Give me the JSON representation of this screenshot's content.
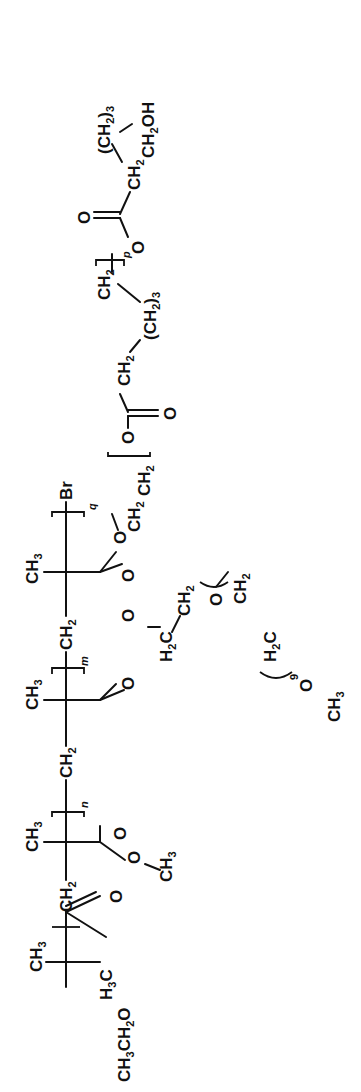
{
  "diagram": {
    "type": "chemical-structure",
    "orientation": "rotated-90-ccw",
    "initiator": {
      "ch3": "CH3",
      "h3c": "H3C",
      "ester_o": "O",
      "ethoxy": "CH3CH2O"
    },
    "block_n": {
      "backbone_ch2": "CH2",
      "ch3": "CH3",
      "carbonyl_o": "O",
      "ester_o": "O",
      "methyl": "CH3",
      "index": "n"
    },
    "block_m": {
      "backbone_ch2": "CH2",
      "ch3": "CH3",
      "carbonyl_o": "O",
      "ester_o": "O",
      "h2c": "H2C",
      "ch2": "CH2",
      "peg_o": "O",
      "peg_ch2": "CH2",
      "peg_h2c": "H2C",
      "peg_repeat": "9",
      "terminal_o": "O",
      "terminal_ch3": "CH3",
      "index": "m"
    },
    "block_q": {
      "backbone_ch2": "CH2",
      "ch3": "CH3",
      "carbonyl_o": "O",
      "ester_o": "O",
      "end_group": "Br",
      "index": "q"
    },
    "side_chain": {
      "ch2_a": "CH2",
      "ch2_b": "CH2",
      "ester_o": "O",
      "carbonyl_o": "O",
      "ch2_c": "CH2",
      "ch2_3_a": "(CH2)3",
      "ch2_d": "CH2",
      "repeat_index": "p",
      "ester_o2": "O",
      "carbonyl_o2": "O",
      "ch2_e": "CH2",
      "ch2_3_b": "(CH2)3",
      "terminal": "CH2OH"
    }
  }
}
